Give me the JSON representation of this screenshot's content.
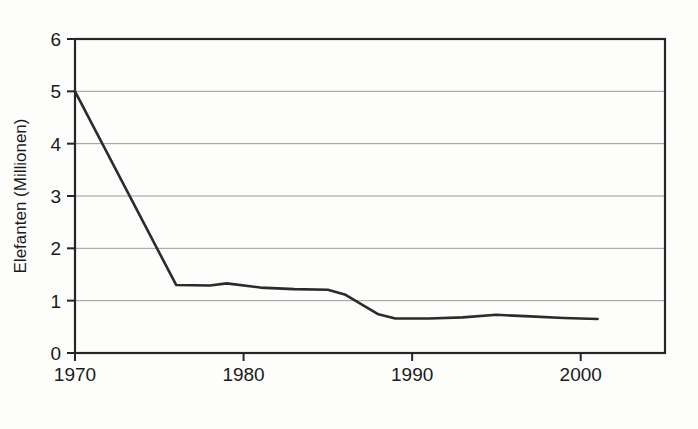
{
  "chart_data": {
    "type": "line",
    "title": "",
    "subtitle": "",
    "xlabel": "",
    "ylabel": "Elefanten (Millionen)",
    "xlim": [
      1970,
      2005
    ],
    "ylim": [
      0,
      6
    ],
    "xticks": [
      1970,
      1980,
      1990,
      2000
    ],
    "xtick_labels": [
      "1970",
      "1980",
      "1990",
      "2000"
    ],
    "yticks": [
      0,
      1,
      2,
      3,
      4,
      5,
      6
    ],
    "ytick_labels": [
      "0",
      "1",
      "2",
      "3",
      "4",
      "5",
      "6"
    ],
    "grid": "horizontal",
    "legend": "none",
    "annotations": [],
    "series": [
      {
        "name": "Elefanten",
        "color": "#2b2b2b",
        "line_width": 2.6,
        "x": [
          1970,
          1976,
          1978,
          1979,
          1981,
          1983,
          1985,
          1986,
          1988,
          1989,
          1991,
          1993,
          1995,
          1997,
          1999,
          2001
        ],
        "values": [
          5.0,
          1.3,
          1.29,
          1.33,
          1.25,
          1.22,
          1.21,
          1.12,
          0.74,
          0.66,
          0.66,
          0.68,
          0.73,
          0.7,
          0.67,
          0.65
        ]
      }
    ]
  },
  "axis": {
    "y_title": "Elefanten (Millionen)"
  },
  "colors": {
    "background": "#fdfdfb",
    "frame": "#262626",
    "grid": "#9a9a9a",
    "line": "#2b2b2b",
    "text": "#1a1a1a"
  }
}
